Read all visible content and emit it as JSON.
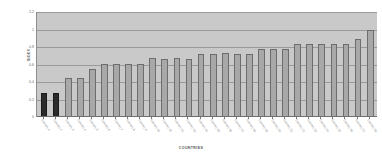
{
  "chart_data": {
    "type": "bar",
    "title": "",
    "xlabel": "COUNTRIES",
    "ylabel": "INDEX",
    "ylim": [
      0,
      1.2
    ],
    "yticks": [
      0,
      0.2,
      0.4,
      0.6,
      0.8,
      1,
      1.2
    ],
    "ytick_labels": [
      "0",
      "0.2",
      "0.4",
      "0.6",
      "0.8",
      "1",
      "1.2"
    ],
    "grid": true,
    "legend": "none",
    "categories": [
      "Country 1",
      "Country 2",
      "Country 3",
      "Country 4",
      "Country 5",
      "Country 6",
      "Country 7",
      "Country 8",
      "Country 9",
      "Country 10",
      "Country 11",
      "Country 12",
      "Country 13",
      "Country 14",
      "Country 15",
      "Country 16",
      "Country 17",
      "Country 18",
      "Country 19",
      "Country 20",
      "Country 21",
      "Country 22",
      "Country 23",
      "Country 24",
      "Country 25",
      "Country 26",
      "Country 27",
      "Country 28"
    ],
    "values": [
      0.27,
      0.27,
      0.45,
      0.45,
      0.55,
      0.61,
      0.61,
      0.61,
      0.61,
      0.67,
      0.66,
      0.67,
      0.66,
      0.72,
      0.72,
      0.73,
      0.72,
      0.72,
      0.78,
      0.78,
      0.78,
      0.84,
      0.84,
      0.84,
      0.84,
      0.84,
      0.89,
      1.0
    ],
    "bar_colors": [
      "#2b2b2b",
      "#2b2b2b",
      "#a8a8a8",
      "#a8a8a8",
      "#a8a8a8",
      "#a8a8a8",
      "#a8a8a8",
      "#a8a8a8",
      "#a8a8a8",
      "#a8a8a8",
      "#a8a8a8",
      "#a8a8a8",
      "#a8a8a8",
      "#a8a8a8",
      "#a8a8a8",
      "#a8a8a8",
      "#a8a8a8",
      "#a8a8a8",
      "#a8a8a8",
      "#a8a8a8",
      "#a8a8a8",
      "#a8a8a8",
      "#a8a8a8",
      "#a8a8a8",
      "#a8a8a8",
      "#a8a8a8",
      "#a8a8a8",
      "#a8a8a8"
    ],
    "highlight_indices": [
      0,
      1
    ],
    "plot_background": "#c9c9c9",
    "gridline_color": "#9a9a9a",
    "figure_background": "#ffffff"
  }
}
